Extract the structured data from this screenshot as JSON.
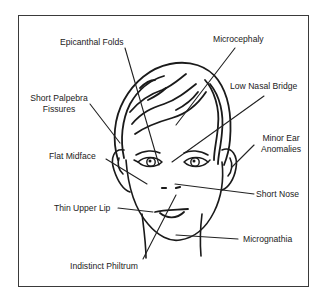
{
  "diagram": {
    "type": "annotated-illustration",
    "subject": "face",
    "colors": {
      "line": "#1a1a1a",
      "text": "#222222",
      "frame": "#3a3a3a",
      "background": "#ffffff"
    },
    "labels": {
      "epicanthal_folds": "Epicanthal Folds",
      "microcephaly": "Microcephaly",
      "short_palpebra_fissures_line1": "Short Palpebra",
      "short_palpebra_fissures_line2": "Fissures",
      "low_nasal_bridge": "Low Nasal Bridge",
      "minor_ear_anomalies_line1": "Minor Ear",
      "minor_ear_anomalies_line2": "Anomalies",
      "flat_midface": "Flat Midface",
      "short_nose": "Short Nose",
      "thin_upper_lip": "Thin Upper Lip",
      "micrognathia": "Micrognathia",
      "indistinct_philtrum": "Indistinct Philtrum"
    }
  }
}
